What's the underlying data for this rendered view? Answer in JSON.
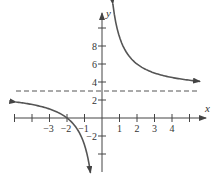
{
  "chart_data": {
    "type": "line",
    "title": "",
    "xlabel": "x",
    "ylabel": "y",
    "function_description": "y = 3 + 6/x (rational function with vertical asymptote x = 0 and horizontal asymptote y = 3)",
    "x_ticks": [
      -5,
      -4,
      -3,
      -2,
      -1,
      1,
      2,
      3,
      4,
      5
    ],
    "x_tick_labels": [
      "-3",
      "-2",
      "-1",
      "1",
      "2",
      "3",
      "4"
    ],
    "x_tick_label_values": [
      -3,
      -2,
      -1,
      1,
      2,
      3,
      4
    ],
    "y_ticks": [
      -4,
      -2,
      2,
      4,
      6,
      8,
      10
    ],
    "y_tick_labels": [
      "-2",
      "2",
      "4",
      "6",
      "8"
    ],
    "y_tick_label_values": [
      -2,
      2,
      4,
      6,
      8
    ],
    "xlim": [
      -5.8,
      5.9
    ],
    "ylim": [
      -6.6,
      11.5
    ],
    "grid": false,
    "legend": null,
    "asymptotes": [
      {
        "type": "horizontal",
        "value": 3,
        "style": "dashed"
      }
    ],
    "series": [
      {
        "name": "right-branch",
        "x": [
          0.55,
          0.7,
          1,
          1.5,
          2,
          3,
          4,
          5
        ],
        "y": [
          13.9,
          11.57,
          9,
          7,
          6,
          5,
          4.5,
          4.2
        ],
        "arrow_ends": true
      },
      {
        "name": "left-branch",
        "x": [
          -4.9,
          -4,
          -3,
          -2,
          -1.5,
          -1,
          -0.8,
          -0.65
        ],
        "y": [
          1.78,
          1.5,
          1,
          0,
          -1,
          -3,
          -4.5,
          -6.2
        ],
        "arrow_ends": true
      }
    ],
    "x_intercept": -2,
    "colors": {
      "curve": "#555555",
      "axis": "#444444",
      "asymptote": "#555555"
    }
  }
}
